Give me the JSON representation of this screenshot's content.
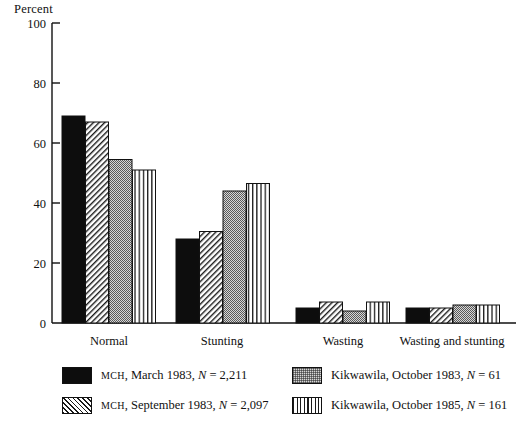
{
  "chart_data": {
    "type": "bar",
    "title": "",
    "ylabel": "Percent",
    "xlabel": "",
    "ylim": [
      0,
      100
    ],
    "yticks": [
      0,
      20,
      40,
      60,
      80,
      100
    ],
    "grid": false,
    "legend_position": "bottom",
    "categories": [
      "Normal",
      "Stunting",
      "Wasting",
      "Wasting and stunting"
    ],
    "series": [
      {
        "name": "MCH, March 1983, N = 2,211",
        "pattern": "solid-black",
        "values": [
          69,
          28,
          5,
          5
        ]
      },
      {
        "name": "MCH, September 1983, N = 2,097",
        "pattern": "diagonal-hatch",
        "values": [
          67,
          30.5,
          7,
          5
        ]
      },
      {
        "name": "Kikwawila, October 1983, N = 61",
        "pattern": "stipple-gray",
        "values": [
          54.5,
          44,
          4,
          6
        ]
      },
      {
        "name": "Kikwawila, October 1985, N = 161",
        "pattern": "vertical-lines",
        "values": [
          51,
          46.5,
          7,
          6
        ]
      }
    ]
  },
  "axis": {
    "y_title": "Percent",
    "tick_100": "100",
    "tick_80": "80",
    "tick_60": "60",
    "tick_40": "40",
    "tick_20": "20",
    "tick_0": "0"
  },
  "categories": {
    "c0": "Normal",
    "c1": "Stunting",
    "c2": "Wasting",
    "c3": "Wasting and stunting"
  },
  "legend": {
    "items": [
      {
        "prefix": "MCH",
        "rest": ", March 1983, ",
        "nvar": "N",
        "value": " = 2,211"
      },
      {
        "prefix": "MCH",
        "rest": ", September 1983, ",
        "nvar": "N",
        "value": " = 2,097"
      },
      {
        "prefix": "Kikwawila",
        "rest": ", October 1983, ",
        "nvar": "N",
        "value": " = 61"
      },
      {
        "prefix": "Kikwawila",
        "rest": ", October 1985, ",
        "nvar": "N",
        "value": " = 161"
      }
    ]
  },
  "colors": {
    "ink": "#111111",
    "solid_fill": "#0d0d0d",
    "stipple_fill": "#d7d7d7",
    "background": "#ffffff"
  }
}
